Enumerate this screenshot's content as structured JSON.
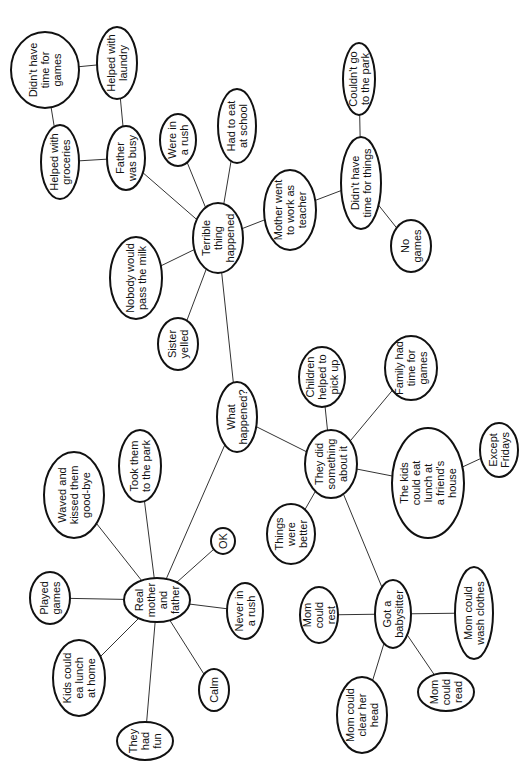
{
  "diagram": {
    "type": "concept-map",
    "orientation": "rotated-90-ccw",
    "colors": {
      "background": "#ffffff",
      "stroke": "#111111",
      "edge": "#333333",
      "text": "#111111"
    },
    "nodes": [
      {
        "id": "didnt_have_time_games",
        "lines": [
          "Didn't have",
          "time for",
          "games"
        ],
        "cx": 45,
        "cy": 70,
        "rx": 34,
        "ry": 38
      },
      {
        "id": "helped_laundry",
        "lines": [
          "Helped with",
          "laundry"
        ],
        "cx": 117,
        "cy": 63,
        "rx": 20,
        "ry": 36
      },
      {
        "id": "helped_groceries",
        "lines": [
          "Helped with",
          "groceries"
        ],
        "cx": 60,
        "cy": 162,
        "rx": 19,
        "ry": 37
      },
      {
        "id": "father_busy",
        "lines": [
          "Father",
          "was busy"
        ],
        "cx": 126,
        "cy": 158,
        "rx": 19,
        "ry": 32
      },
      {
        "id": "were_in_rush",
        "lines": [
          "Were in",
          "a rush"
        ],
        "cx": 178,
        "cy": 140,
        "rx": 18,
        "ry": 26
      },
      {
        "id": "eat_school",
        "lines": [
          "Had to eat",
          "at school"
        ],
        "cx": 237,
        "cy": 126,
        "rx": 19,
        "ry": 37
      },
      {
        "id": "terrible_thing",
        "lines": [
          "Terrible",
          "thing",
          "happened"
        ],
        "cx": 218,
        "cy": 238,
        "rx": 25,
        "ry": 35
      },
      {
        "id": "nobody_milk",
        "lines": [
          "Nobody would",
          "pass the milk"
        ],
        "cx": 136,
        "cy": 278,
        "rx": 26,
        "ry": 41
      },
      {
        "id": "sister_yelled",
        "lines": [
          "Sister",
          "yelled"
        ],
        "cx": 178,
        "cy": 344,
        "rx": 20,
        "ry": 26
      },
      {
        "id": "mother_teacher",
        "lines": [
          "Mother went",
          "to work as",
          "teacher"
        ],
        "cx": 290,
        "cy": 210,
        "rx": 26,
        "ry": 40
      },
      {
        "id": "no_time_things",
        "lines": [
          "Didn't have",
          "time for things"
        ],
        "cx": 361,
        "cy": 183,
        "rx": 20,
        "ry": 46
      },
      {
        "id": "couldnt_park",
        "lines": [
          "Couldn't go",
          "to the park"
        ],
        "cx": 359,
        "cy": 79,
        "rx": 16,
        "ry": 36
      },
      {
        "id": "no_games",
        "lines": [
          "No",
          "games"
        ],
        "cx": 411,
        "cy": 246,
        "rx": 20,
        "ry": 26
      },
      {
        "id": "what_happened",
        "lines": [
          "What",
          "happened?"
        ],
        "cx": 237,
        "cy": 417,
        "rx": 20,
        "ry": 35
      },
      {
        "id": "children_pickup",
        "lines": [
          "Children",
          "helped to",
          "pick up"
        ],
        "cx": 322,
        "cy": 377,
        "rx": 23,
        "ry": 30
      },
      {
        "id": "family_games",
        "lines": [
          "Family had",
          "time for",
          "games"
        ],
        "cx": 411,
        "cy": 368,
        "rx": 26,
        "ry": 32
      },
      {
        "id": "did_something",
        "lines": [
          "They did",
          "something",
          "about it"
        ],
        "cx": 331,
        "cy": 464,
        "rx": 26,
        "ry": 34
      },
      {
        "id": "kids_friends",
        "lines": [
          "The kids",
          "could eat",
          "lunch at",
          "a friend's",
          "house"
        ],
        "cx": 428,
        "cy": 483,
        "rx": 36,
        "ry": 55
      },
      {
        "id": "except_fridays",
        "lines": [
          "Except",
          "Fridays"
        ],
        "cx": 499,
        "cy": 450,
        "rx": 19,
        "ry": 27
      },
      {
        "id": "things_better",
        "lines": [
          "Things",
          "were",
          "better"
        ],
        "cx": 291,
        "cy": 534,
        "rx": 24,
        "ry": 30
      },
      {
        "id": "babysitter",
        "lines": [
          "Got a",
          "babysitter"
        ],
        "cx": 393,
        "cy": 614,
        "rx": 18,
        "ry": 34
      },
      {
        "id": "mom_rest",
        "lines": [
          "Mom",
          "could",
          "rest"
        ],
        "cx": 319,
        "cy": 615,
        "rx": 19,
        "ry": 28
      },
      {
        "id": "mom_wash",
        "lines": [
          "Mom could",
          "wash clothes"
        ],
        "cx": 474,
        "cy": 613,
        "rx": 19,
        "ry": 46
      },
      {
        "id": "mom_clear_head",
        "lines": [
          "Mom could",
          "clear her",
          "head"
        ],
        "cx": 362,
        "cy": 715,
        "rx": 25,
        "ry": 38
      },
      {
        "id": "mom_read",
        "lines": [
          "Mom",
          "could",
          "read"
        ],
        "cx": 446,
        "cy": 692,
        "rx": 28,
        "ry": 19
      },
      {
        "id": "real_parents",
        "lines": [
          "Real",
          "mother",
          "and",
          "father"
        ],
        "cx": 157,
        "cy": 600,
        "rx": 33,
        "ry": 22
      },
      {
        "id": "played_games",
        "lines": [
          "Played",
          "games"
        ],
        "cx": 50,
        "cy": 598,
        "rx": 20,
        "ry": 26
      },
      {
        "id": "waved_kissed",
        "lines": [
          "Waved and",
          "kissed them",
          "good-bye"
        ],
        "cx": 74,
        "cy": 495,
        "rx": 30,
        "ry": 43
      },
      {
        "id": "took_park",
        "lines": [
          "Took them",
          "to the park"
        ],
        "cx": 140,
        "cy": 466,
        "rx": 21,
        "ry": 36
      },
      {
        "id": "ok",
        "lines": [
          "OK"
        ],
        "cx": 223,
        "cy": 541,
        "rx": 12,
        "ry": 13
      },
      {
        "id": "never_rush",
        "lines": [
          "Never in",
          "a rush"
        ],
        "cx": 245,
        "cy": 611,
        "rx": 18,
        "ry": 28
      },
      {
        "id": "kids_lunch_home",
        "lines": [
          "Kids could",
          "ea  lunch",
          "at home"
        ],
        "cx": 79,
        "cy": 678,
        "rx": 26,
        "ry": 38
      },
      {
        "id": "calm",
        "lines": [
          "Calm"
        ],
        "cx": 214,
        "cy": 690,
        "rx": 15,
        "ry": 21
      },
      {
        "id": "had_fun",
        "lines": [
          "They",
          "had",
          "fun"
        ],
        "cx": 145,
        "cy": 741,
        "rx": 28,
        "ry": 19
      }
    ],
    "edges": [
      [
        "didnt_have_time_games",
        "helped_laundry"
      ],
      [
        "didnt_have_time_games",
        "helped_groceries"
      ],
      [
        "helped_laundry",
        "father_busy"
      ],
      [
        "helped_groceries",
        "father_busy"
      ],
      [
        "father_busy",
        "terrible_thing"
      ],
      [
        "were_in_rush",
        "terrible_thing"
      ],
      [
        "eat_school",
        "terrible_thing"
      ],
      [
        "nobody_milk",
        "terrible_thing"
      ],
      [
        "sister_yelled",
        "terrible_thing"
      ],
      [
        "terrible_thing",
        "mother_teacher"
      ],
      [
        "mother_teacher",
        "no_time_things"
      ],
      [
        "no_time_things",
        "couldnt_park"
      ],
      [
        "no_time_things",
        "no_games"
      ],
      [
        "terrible_thing",
        "what_happened"
      ],
      [
        "what_happened",
        "did_something"
      ],
      [
        "what_happened",
        "real_parents"
      ],
      [
        "did_something",
        "children_pickup"
      ],
      [
        "did_something",
        "family_games"
      ],
      [
        "did_something",
        "kids_friends"
      ],
      [
        "kids_friends",
        "except_fridays"
      ],
      [
        "did_something",
        "things_better"
      ],
      [
        "did_something",
        "babysitter"
      ],
      [
        "babysitter",
        "mom_rest"
      ],
      [
        "babysitter",
        "mom_wash"
      ],
      [
        "babysitter",
        "mom_clear_head"
      ],
      [
        "babysitter",
        "mom_read"
      ],
      [
        "real_parents",
        "played_games"
      ],
      [
        "real_parents",
        "waved_kissed"
      ],
      [
        "real_parents",
        "took_park"
      ],
      [
        "real_parents",
        "ok"
      ],
      [
        "real_parents",
        "never_rush"
      ],
      [
        "real_parents",
        "kids_lunch_home"
      ],
      [
        "real_parents",
        "calm"
      ],
      [
        "real_parents",
        "had_fun"
      ]
    ]
  }
}
